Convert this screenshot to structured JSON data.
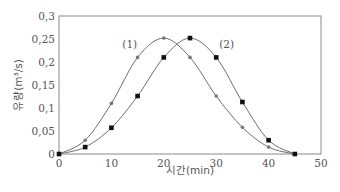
{
  "chart_data": {
    "type": "line",
    "title": "",
    "xlabel": "시간(min)",
    "ylabel": "유량(m³/s)",
    "xlim": [
      0,
      50
    ],
    "ylim": [
      0,
      0.3
    ],
    "x_ticks": [
      0,
      10,
      20,
      30,
      40,
      50
    ],
    "y_ticks": [
      0,
      0.05,
      0.1,
      0.15,
      0.2,
      0.25,
      0.3
    ],
    "y_tick_labels": [
      "0",
      "0,05",
      "0,1",
      "0,15",
      "0,2",
      "0,25",
      "0,3"
    ],
    "grid": false,
    "legend_position": "inline annotations",
    "series": [
      {
        "name": "(1)",
        "marker": "circle",
        "color": "#777777",
        "x": [
          0,
          5,
          10,
          15,
          20,
          25,
          30,
          35,
          40,
          45
        ],
        "values": [
          0,
          0.03,
          0.11,
          0.21,
          0.252,
          0.21,
          0.126,
          0.058,
          0.015,
          0
        ]
      },
      {
        "name": "(2)",
        "marker": "square",
        "color": "#111111",
        "x": [
          0,
          5,
          10,
          15,
          20,
          25,
          30,
          35,
          40,
          45
        ],
        "values": [
          0,
          0.015,
          0.057,
          0.126,
          0.21,
          0.252,
          0.21,
          0.113,
          0.03,
          0
        ]
      }
    ],
    "annotations": [
      {
        "text": "(1)",
        "x": 13.5,
        "y": 0.23
      },
      {
        "text": "(2)",
        "x": 32,
        "y": 0.23
      }
    ]
  }
}
